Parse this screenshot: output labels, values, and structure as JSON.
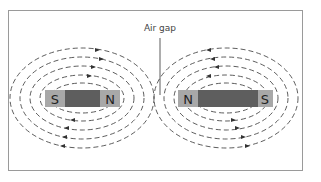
{
  "diagram": {
    "annotation": "Air gap",
    "magnets": [
      {
        "left_pole": "S",
        "right_pole": "N"
      },
      {
        "left_pole": "N",
        "right_pole": "S"
      }
    ],
    "colors": {
      "frame": "#9a9a9a",
      "pole": "#a8a8a8",
      "magnet_body": "#5e5e5e",
      "field_line": "#333333",
      "label": "#333333"
    }
  }
}
